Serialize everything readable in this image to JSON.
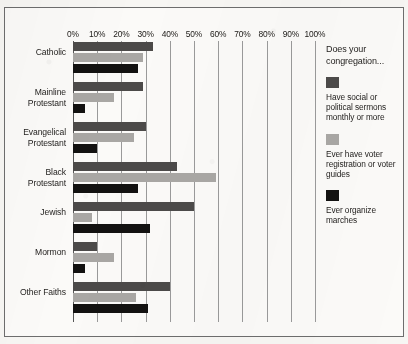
{
  "chart_data": {
    "type": "bar",
    "orientation": "horizontal",
    "grouped": true,
    "title": "",
    "subtitle": "",
    "xlabel": "",
    "ylabel": "",
    "xlim": [
      0,
      100
    ],
    "xtick_labels": [
      "0%",
      "10%",
      "20%",
      "30%",
      "40%",
      "50%",
      "60%",
      "70%",
      "80%",
      "90%",
      "100%"
    ],
    "xtick_values": [
      0,
      10,
      20,
      30,
      40,
      50,
      60,
      70,
      80,
      90,
      100
    ],
    "grid": "vertical",
    "legend_position": "right",
    "legend_title": "Does your congregation...",
    "categories": [
      "Catholic",
      "Mainline Protestant",
      "Evangelical Protestant",
      "Black Protestant",
      "Jewish",
      "Mormon",
      "Other Faiths"
    ],
    "series": [
      {
        "name": "Have social or political sermons monthly or more",
        "color": "#4c4a49",
        "values": [
          33,
          29,
          30,
          43,
          50,
          10,
          40
        ]
      },
      {
        "name": "Ever have voter registration or voter guides",
        "color": "#a9a7a4",
        "values": [
          29,
          17,
          25,
          59,
          8,
          17,
          26
        ]
      },
      {
        "name": "Ever organize marches",
        "color": "#131211",
        "values": [
          27,
          5,
          10,
          27,
          32,
          5,
          31
        ]
      }
    ]
  },
  "legend": {
    "title": "Does your congregation...",
    "entries": [
      {
        "label": "Have social or political sermons monthly or more",
        "color": "#4c4a49",
        "swatch_name": "legend-swatch-sermons"
      },
      {
        "label": "Ever have voter registration or voter guides",
        "color": "#a9a7a4",
        "swatch_name": "legend-swatch-voter-registration"
      },
      {
        "label": "Ever organize marches",
        "color": "#131211",
        "swatch_name": "legend-swatch-marches"
      }
    ]
  },
  "axis": {
    "x_labels": [
      "0%",
      "10%",
      "20%",
      "30%",
      "40%",
      "50%",
      "60%",
      "70%",
      "80%",
      "90%",
      "100%"
    ],
    "y_labels": [
      "Catholic",
      "Mainline\nProtestant",
      "Evangelical\nProtestant",
      "Black\nProtestant",
      "Jewish",
      "Mormon",
      "Other Faiths"
    ]
  }
}
